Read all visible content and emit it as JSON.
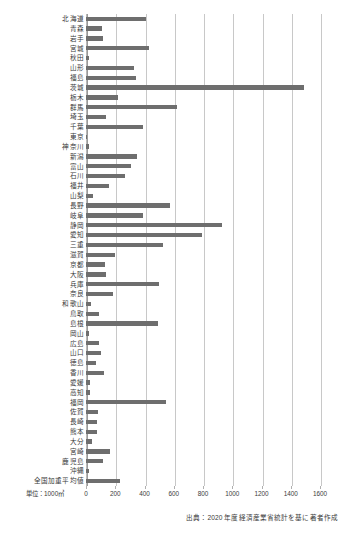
{
  "chart_data": {
    "type": "bar",
    "orientation": "horizontal",
    "title": "",
    "subtitle": "",
    "xlabel": "",
    "ylabel": "",
    "unit_label": "単位：1000㎥",
    "source_note": "出典：2020 年度経済産業省統計を基に著者作成",
    "xlim": [
      0,
      1600
    ],
    "xticks": [
      0,
      200,
      400,
      600,
      800,
      1000,
      1200,
      1400,
      1600
    ],
    "xtick_labels": [
      "0",
      "200",
      "400",
      "600",
      "800",
      "1000",
      "1200",
      "1400",
      "1600"
    ],
    "grid": "vertical",
    "legend": "none",
    "bar_color": "#6e6e6e",
    "categories": [
      "北海道",
      "青森",
      "岩手",
      "宮城",
      "秋田",
      "山形",
      "福島",
      "茨城",
      "栃木",
      "群馬",
      "埼玉",
      "千葉",
      "東京",
      "神奈川",
      "新潟",
      "富山",
      "石川",
      "福井",
      "山梨",
      "長野",
      "岐阜",
      "静岡",
      "愛知",
      "三重",
      "滋賀",
      "京都",
      "大阪",
      "兵庫",
      "奈良",
      "和歌山",
      "鳥取",
      "島根",
      "岡山",
      "広島",
      "山口",
      "徳島",
      "香川",
      "愛媛",
      "高知",
      "福岡",
      "佐賀",
      "長崎",
      "熊本",
      "大分",
      "宮崎",
      "鹿児島",
      "沖縄",
      "全国加重平均値"
    ],
    "values": [
      410,
      110,
      115,
      430,
      18,
      330,
      345,
      1490,
      220,
      620,
      135,
      390,
      5,
      20,
      350,
      310,
      265,
      155,
      45,
      575,
      390,
      930,
      795,
      525,
      195,
      130,
      140,
      500,
      185,
      35,
      90,
      490,
      20,
      90,
      105,
      65,
      120,
      28,
      28,
      548,
      80,
      75,
      75,
      38,
      165,
      115,
      22,
      232
    ]
  }
}
